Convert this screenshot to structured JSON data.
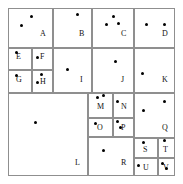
{
  "figure": {
    "title": "",
    "type": "kd-tree-partition-diagram",
    "canvas": {
      "width": 183,
      "height": 184
    },
    "border": {
      "x": 8,
      "y": 8,
      "width": 167,
      "height": 168,
      "color": "#6b6b6b"
    },
    "line_color": "#8f8f8f",
    "dot_color": "#000000"
  },
  "regions": [
    {
      "id": "A",
      "label": "A",
      "x": 8,
      "y": 8,
      "w": 45,
      "h": 40,
      "label_x": 44,
      "label_y": 38
    },
    {
      "id": "B",
      "label": "B",
      "x": 53,
      "y": 8,
      "w": 39,
      "h": 40,
      "label_x": 83,
      "label_y": 38
    },
    {
      "id": "C",
      "label": "C",
      "x": 92,
      "y": 8,
      "w": 42,
      "h": 40,
      "label_x": 125,
      "label_y": 38
    },
    {
      "id": "D",
      "label": "D",
      "x": 134,
      "y": 8,
      "w": 41,
      "h": 40,
      "label_x": 166,
      "label_y": 38
    },
    {
      "id": "E",
      "label": "E",
      "x": 8,
      "y": 48,
      "w": 24,
      "h": 22,
      "label_x": 20,
      "label_y": 61
    },
    {
      "id": "F",
      "label": "F",
      "x": 32,
      "y": 48,
      "w": 21,
      "h": 22,
      "label_x": 44,
      "label_y": 61
    },
    {
      "id": "G",
      "label": "G",
      "x": 8,
      "y": 70,
      "w": 24,
      "h": 23,
      "label_x": 20,
      "label_y": 84
    },
    {
      "id": "H",
      "label": "H",
      "x": 32,
      "y": 70,
      "w": 21,
      "h": 23,
      "label_x": 44,
      "label_y": 86
    },
    {
      "id": "I",
      "label": "I",
      "x": 53,
      "y": 48,
      "w": 39,
      "h": 45,
      "label_x": 84,
      "label_y": 84
    },
    {
      "id": "J",
      "label": "J",
      "x": 92,
      "y": 48,
      "w": 42,
      "h": 45,
      "label_x": 125,
      "label_y": 84
    },
    {
      "id": "K",
      "label": "K",
      "x": 134,
      "y": 48,
      "w": 41,
      "h": 45,
      "label_x": 166,
      "label_y": 84
    },
    {
      "id": "L",
      "label": "L",
      "x": 8,
      "y": 93,
      "w": 80,
      "h": 83,
      "label_x": 79,
      "label_y": 167
    },
    {
      "id": "M",
      "label": "M",
      "x": 88,
      "y": 93,
      "w": 25,
      "h": 25,
      "label_x": 101,
      "label_y": 111
    },
    {
      "id": "N",
      "label": "N",
      "x": 113,
      "y": 93,
      "w": 21,
      "h": 25,
      "label_x": 125,
      "label_y": 111
    },
    {
      "id": "O",
      "label": "O",
      "x": 88,
      "y": 118,
      "w": 25,
      "h": 19,
      "label_x": 101,
      "label_y": 132
    },
    {
      "id": "P",
      "label": "P",
      "x": 113,
      "y": 118,
      "w": 21,
      "h": 19,
      "label_x": 125,
      "label_y": 132
    },
    {
      "id": "Q",
      "label": "Q",
      "x": 134,
      "y": 93,
      "w": 41,
      "h": 45,
      "label_x": 166,
      "label_y": 132
    },
    {
      "id": "R",
      "label": "R",
      "x": 88,
      "y": 137,
      "w": 46,
      "h": 39,
      "label_x": 125,
      "label_y": 167
    },
    {
      "id": "S",
      "label": "S",
      "x": 134,
      "y": 138,
      "w": 24,
      "h": 20,
      "label_x": 147,
      "label_y": 154
    },
    {
      "id": "T",
      "label": "T",
      "x": 158,
      "y": 138,
      "w": 17,
      "h": 20,
      "label_x": 167,
      "label_y": 154
    },
    {
      "id": "U",
      "label": "U",
      "x": 134,
      "y": 158,
      "w": 24,
      "h": 18,
      "label_x": 147,
      "label_y": 172
    },
    {
      "id": "V",
      "label": "V",
      "x": 158,
      "y": 158,
      "w": 17,
      "h": 18,
      "label_x": 167,
      "label_y": 172
    }
  ],
  "points": [
    {
      "x": 31,
      "y": 16,
      "region": "A"
    },
    {
      "x": 21,
      "y": 25,
      "region": "A"
    },
    {
      "x": 77,
      "y": 14,
      "region": "B"
    },
    {
      "x": 113,
      "y": 16,
      "region": "C"
    },
    {
      "x": 106,
      "y": 24,
      "region": "C"
    },
    {
      "x": 118,
      "y": 23,
      "region": "C"
    },
    {
      "x": 146,
      "y": 24,
      "region": "D"
    },
    {
      "x": 164,
      "y": 24,
      "region": "D"
    },
    {
      "x": 16,
      "y": 52,
      "region": "E"
    },
    {
      "x": 37,
      "y": 57,
      "region": "F"
    },
    {
      "x": 16,
      "y": 75,
      "region": "G"
    },
    {
      "x": 41,
      "y": 74,
      "region": "H"
    },
    {
      "x": 37,
      "y": 82,
      "region": "H"
    },
    {
      "x": 67,
      "y": 69,
      "region": "I"
    },
    {
      "x": 115,
      "y": 61,
      "region": "J"
    },
    {
      "x": 142,
      "y": 73,
      "region": "K"
    },
    {
      "x": 35,
      "y": 122,
      "region": "L"
    },
    {
      "x": 97,
      "y": 97,
      "region": "M"
    },
    {
      "x": 103,
      "y": 95,
      "region": "M"
    },
    {
      "x": 117,
      "y": 101,
      "region": "N"
    },
    {
      "x": 95,
      "y": 123,
      "region": "O"
    },
    {
      "x": 117,
      "y": 121,
      "region": "P"
    },
    {
      "x": 120,
      "y": 127,
      "region": "P"
    },
    {
      "x": 143,
      "y": 110,
      "region": "Q"
    },
    {
      "x": 164,
      "y": 101,
      "region": "Q"
    },
    {
      "x": 103,
      "y": 150,
      "region": "R"
    },
    {
      "x": 143,
      "y": 142,
      "region": "S"
    },
    {
      "x": 164,
      "y": 140,
      "region": "T"
    },
    {
      "x": 138,
      "y": 165,
      "region": "U"
    },
    {
      "x": 162,
      "y": 163,
      "region": "V"
    },
    {
      "x": 166,
      "y": 168,
      "region": "V"
    }
  ]
}
